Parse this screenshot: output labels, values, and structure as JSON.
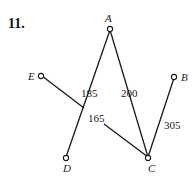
{
  "problem_number": "11.",
  "nodes": [
    {
      "id": "A",
      "label": "A"
    },
    {
      "id": "B",
      "label": "B"
    },
    {
      "id": "C",
      "label": "C"
    },
    {
      "id": "D",
      "label": "D"
    },
    {
      "id": "E",
      "label": "E"
    }
  ],
  "edges": [
    {
      "from": "A",
      "to": "D",
      "weight": "185"
    },
    {
      "from": "A",
      "to": "C",
      "weight": "200"
    },
    {
      "from": "E",
      "to": "C",
      "weight": "165"
    },
    {
      "from": "B",
      "to": "C",
      "weight": "305"
    }
  ]
}
